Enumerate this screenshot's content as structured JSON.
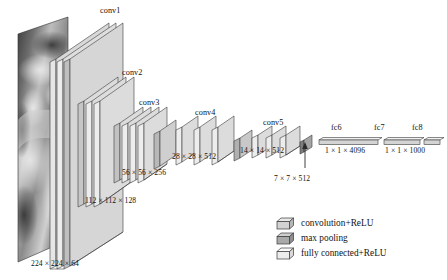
{
  "figure": {
    "type": "cnn-architecture-diagram",
    "input": {
      "name": "input-image",
      "description": "grayscale photograph"
    },
    "blocks": [
      {
        "id": "conv1",
        "label": "conv1",
        "dim": "224 × 224 × 64",
        "conv_layers": 2,
        "kind": "convolution+ReLU"
      },
      {
        "id": "conv2",
        "label": "conv2",
        "dim": "112 × 112 × 128",
        "conv_layers": 2,
        "kind": "convolution+ReLU"
      },
      {
        "id": "conv3",
        "label": "conv3",
        "dim": "56 × 56 × 256",
        "conv_layers": 3,
        "kind": "convolution+ReLU"
      },
      {
        "id": "conv4",
        "label": "conv4",
        "dim": "28 × 28 × 512",
        "conv_layers": 3,
        "kind": "convolution+ReLU"
      },
      {
        "id": "conv5",
        "label": "conv5",
        "dim": "14 × 14 × 512",
        "conv_layers": 3,
        "kind": "convolution+ReLU"
      }
    ],
    "pool_callout": {
      "label": "7 × 7 × 512",
      "target": "final-max-pooling"
    },
    "fc": [
      {
        "id": "fc6",
        "label": "fc6",
        "dim": "1 × 1 × 4096"
      },
      {
        "id": "fc7",
        "label": "fc7",
        "dim": ""
      },
      {
        "id": "fc8",
        "label": "fc8",
        "dim": "1 × 1 × 1000"
      }
    ],
    "fc_dims": [
      {
        "text": "1 × 1 × 4096"
      },
      {
        "text": "1 × 1 × 1000"
      }
    ],
    "legend": [
      {
        "icon": "conv-box-icon",
        "label": "convolution+ReLU"
      },
      {
        "icon": "pool-box-icon",
        "label": "max  pooling"
      },
      {
        "icon": "fc-box-icon",
        "label": "fully  connected+ReLU"
      }
    ],
    "colors": {
      "conv_face": "#d2d2d2",
      "conv_top": "#eaeaea",
      "conv_side": "#b4b4b4",
      "pool_face": "#a9a9a9",
      "pool_top": "#cfcfcf",
      "fc_face": "#ececec",
      "fc_top": "#f7f7f7",
      "stroke": "#3a3a3a",
      "text": "#111111",
      "background": "#ffffff"
    }
  }
}
